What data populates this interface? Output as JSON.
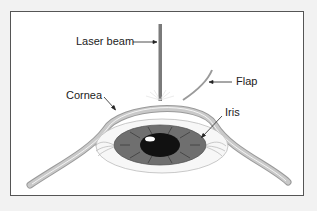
{
  "figure": {
    "labels": {
      "laser_beam": "Laser beam",
      "flap": "Flap",
      "cornea": "Cornea",
      "iris": "Iris"
    }
  },
  "colors": {
    "background": "#f2f2f2",
    "frame_fill": "#ffffff",
    "frame_border": "#555555",
    "cornea_fill": "#bdbdbd",
    "laser_beam": "#7a7a7a",
    "iris": "#6f6f6f",
    "pupil": "#111111",
    "text": "#222222"
  }
}
